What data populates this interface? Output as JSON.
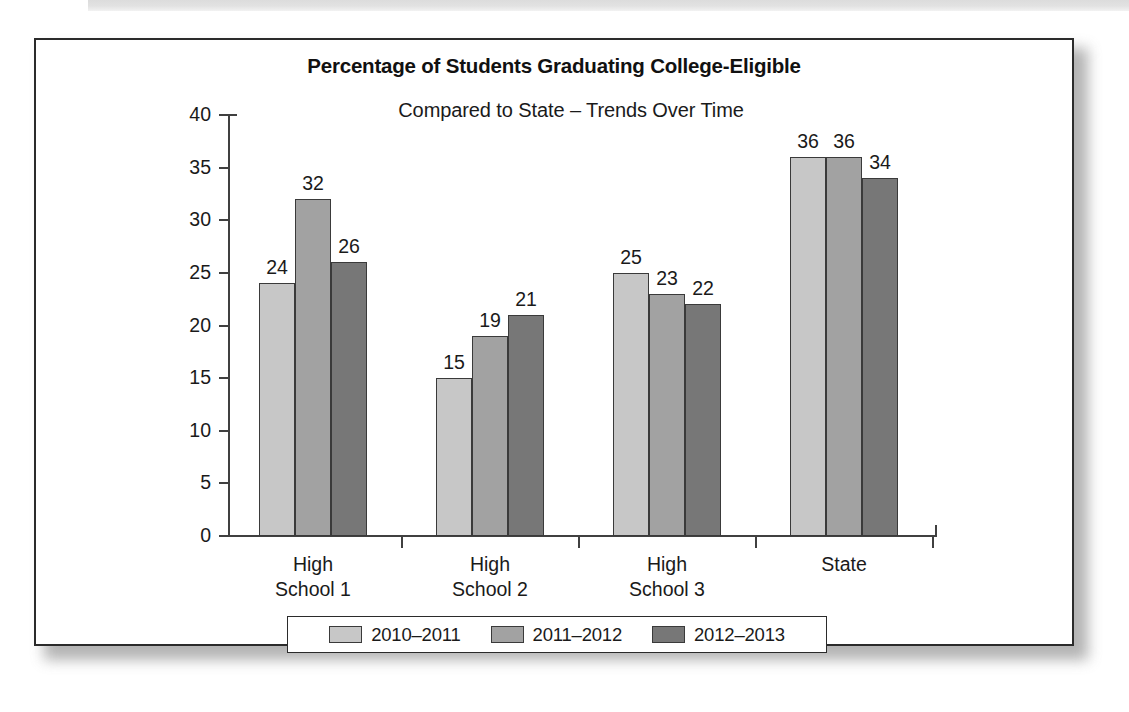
{
  "figure": {
    "title": "Percentage of Students Graduating College-Eligible",
    "subtitle": "Compared to State – Trends Over Time"
  },
  "chart_data": {
    "type": "bar",
    "title": "Percentage of Students Graduating College-Eligible",
    "subtitle": "Compared to State – Trends Over Time",
    "xlabel": "",
    "ylabel": "",
    "ylim": [
      0,
      40
    ],
    "ytick_step": 5,
    "yticks": [
      0,
      5,
      10,
      15,
      20,
      25,
      30,
      35,
      40
    ],
    "ytick_labels": [
      "0",
      "5",
      "10",
      "15",
      "20",
      "25",
      "30",
      "35",
      "40"
    ],
    "grid": false,
    "legend_position": "bottom",
    "categories": [
      "High School 1",
      "High School 2",
      "High School 3",
      "State"
    ],
    "category_lines": [
      [
        "High",
        "School 1"
      ],
      [
        "High",
        "School 2"
      ],
      [
        "High",
        "School 3"
      ],
      [
        "State",
        ""
      ]
    ],
    "series": [
      {
        "name": "2010–2011",
        "color": "#c7c7c7",
        "values": [
          24,
          15,
          25,
          36
        ],
        "labels": [
          "24",
          "15",
          "25",
          "36"
        ]
      },
      {
        "name": "2011–2012",
        "color": "#a2a2a2",
        "values": [
          32,
          19,
          23,
          36
        ],
        "labels": [
          "32",
          "19",
          "23",
          "36"
        ]
      },
      {
        "name": "2012–2013",
        "color": "#777777",
        "values": [
          26,
          21,
          22,
          34
        ],
        "labels": [
          "26",
          "21",
          "22",
          "34"
        ]
      }
    ]
  },
  "colors": {
    "series_1": "#c7c7c7",
    "series_2": "#a2a2a2",
    "series_3": "#777777",
    "axis": "#404040",
    "frame": "#2b2b2b",
    "text": "#1a1a1a"
  }
}
